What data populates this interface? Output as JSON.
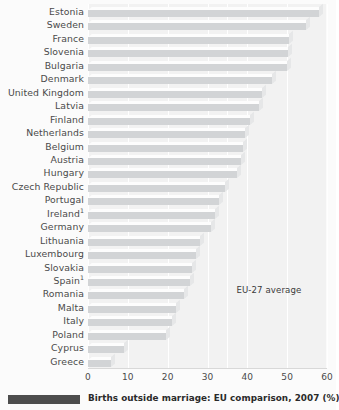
{
  "caption": {
    "text": "Births outside marriage: EU comparison, 2007 (%)",
    "swatch_color": "#4d4d4d"
  },
  "annotation": {
    "eu_average_label": "EU-27 average",
    "eu_average_value": 35
  },
  "style": {
    "bar_color": "#d2d4d6",
    "plot_background": "#f2f2f2",
    "gridline_color": "#ffffff",
    "text_color": "#4a4a4a"
  },
  "chart_data": {
    "type": "bar",
    "orientation": "horizontal",
    "title": "Births outside marriage: EU comparison, 2007 (%)",
    "xlabel": "",
    "ylabel": "",
    "xlim": [
      0,
      60
    ],
    "xticks": [
      0,
      10,
      20,
      30,
      40,
      50,
      60
    ],
    "grid": true,
    "legend": false,
    "annotations": [
      {
        "label": "EU-27 average",
        "value": 35,
        "type": "reference-line"
      }
    ],
    "footnotes": [
      "1"
    ],
    "categories": [
      "Estonia",
      "Sweden",
      "France",
      "Slovenia",
      "Bulgaria",
      "Denmark",
      "United Kingdom",
      "Latvia",
      "Finland",
      "Netherlands",
      "Belgium",
      "Austria",
      "Hungary",
      "Czech Republic",
      "Portugal",
      "Ireland",
      "Germany",
      "Lithuania",
      "Luxembourg",
      "Slovakia",
      "Spain",
      "Romania",
      "Malta",
      "Italy",
      "Poland",
      "Cyprus",
      "Greece"
    ],
    "category_footnotes": {
      "Ireland": "1",
      "Spain": "1"
    },
    "values": [
      58.0,
      54.8,
      50.4,
      50.2,
      50.0,
      46.1,
      43.7,
      43.0,
      40.6,
      39.5,
      39.0,
      38.3,
      37.5,
      34.5,
      33.0,
      32.0,
      30.8,
      28.0,
      27.0,
      26.0,
      25.5,
      24.0,
      22.0,
      21.0,
      19.5,
      9.0,
      5.8
    ],
    "rows": [
      {
        "label": "Estonia",
        "footnote": "",
        "value": 58.0
      },
      {
        "label": "Sweden",
        "footnote": "",
        "value": 54.8
      },
      {
        "label": "France",
        "footnote": "",
        "value": 50.4
      },
      {
        "label": "Slovenia",
        "footnote": "",
        "value": 50.2
      },
      {
        "label": "Bulgaria",
        "footnote": "",
        "value": 50.0
      },
      {
        "label": "Denmark",
        "footnote": "",
        "value": 46.1
      },
      {
        "label": "United Kingdom",
        "footnote": "",
        "value": 43.7
      },
      {
        "label": "Latvia",
        "footnote": "",
        "value": 43.0
      },
      {
        "label": "Finland",
        "footnote": "",
        "value": 40.6
      },
      {
        "label": "Netherlands",
        "footnote": "",
        "value": 39.5
      },
      {
        "label": "Belgium",
        "footnote": "",
        "value": 39.0
      },
      {
        "label": "Austria",
        "footnote": "",
        "value": 38.3
      },
      {
        "label": "Hungary",
        "footnote": "",
        "value": 37.5
      },
      {
        "label": "Czech Republic",
        "footnote": "",
        "value": 34.5
      },
      {
        "label": "Portugal",
        "footnote": "",
        "value": 33.0
      },
      {
        "label": "Ireland",
        "footnote": "1",
        "value": 32.0
      },
      {
        "label": "Germany",
        "footnote": "",
        "value": 30.8
      },
      {
        "label": "Lithuania",
        "footnote": "",
        "value": 28.0
      },
      {
        "label": "Luxembourg",
        "footnote": "",
        "value": 27.0
      },
      {
        "label": "Slovakia",
        "footnote": "",
        "value": 26.0
      },
      {
        "label": "Spain",
        "footnote": "1",
        "value": 25.5
      },
      {
        "label": "Romania",
        "footnote": "",
        "value": 24.0
      },
      {
        "label": "Malta",
        "footnote": "",
        "value": 22.0
      },
      {
        "label": "Italy",
        "footnote": "",
        "value": 21.0
      },
      {
        "label": "Poland",
        "footnote": "",
        "value": 19.5
      },
      {
        "label": "Cyprus",
        "footnote": "",
        "value": 9.0
      },
      {
        "label": "Greece",
        "footnote": "",
        "value": 5.8
      }
    ]
  }
}
